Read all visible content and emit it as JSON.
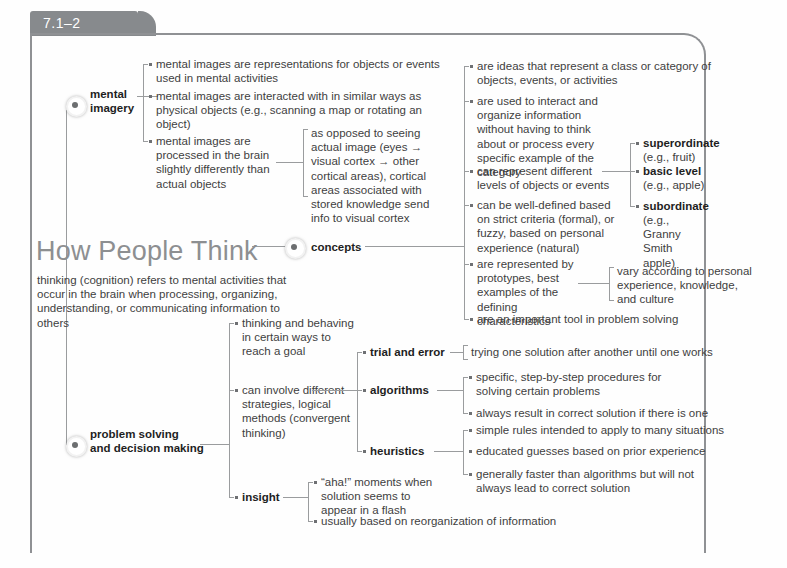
{
  "tab": {
    "label": "7.1–2"
  },
  "center": {
    "title": "How People Think",
    "subtitle": "thinking (cognition) refers to mental activities that occur in the brain when processing, organizing, understanding, or communicating information to others"
  },
  "nodes": {
    "mental_imagery": "mental\nimagery",
    "mental_imagery_line1": "mental",
    "mental_imagery_line2": "imagery",
    "concepts": "concepts",
    "problem_solving_line1": "problem solving",
    "problem_solving_line2": "and decision making"
  },
  "mental_imagery_branch": [
    {
      "name": "representations",
      "text": "mental images are representations for objects or events used in mental activities"
    },
    {
      "name": "interaction",
      "text": "mental images are interacted with in similar ways as physical objects (e.g., scanning a map or rotating an object)"
    },
    {
      "name": "processing",
      "text": "mental images are processed in the brain slightly differently than actual objects"
    }
  ],
  "mental_imagery_detail": {
    "name": "visual-cortex-path",
    "text": "as opposed to seeing actual image (eyes → visual cortex → other cortical areas), cortical areas associated with stored knowledge send info to visual cortex"
  },
  "concepts_branch": [
    {
      "name": "ideas-class-category",
      "text": "are ideas that represent a class or category of objects, events, or activities"
    },
    {
      "name": "interact-organize",
      "text": "are used to interact and organize information without having to think about or process every specific example of the category"
    },
    {
      "name": "different-levels",
      "text": "can represent different levels of objects or events"
    },
    {
      "name": "well-defined-fuzzy",
      "text": "can be well-defined based on strict criteria (formal), or fuzzy, based on personal experience (natural)"
    },
    {
      "name": "prototypes",
      "text": "are represented by prototypes, best examples of the defining characteristics"
    },
    {
      "name": "important-tool",
      "text": "are an important tool in problem solving"
    }
  ],
  "levels": [
    {
      "name": "superordinate",
      "label": "superordinate",
      "example": "(e.g., fruit)"
    },
    {
      "name": "basic-level",
      "label": "basic level",
      "example": "(e.g., apple)"
    },
    {
      "name": "subordinate",
      "label": "subordinate",
      "example": "(e.g., Granny Smith apple)"
    }
  ],
  "prototypes_detail": {
    "name": "vary-according",
    "text": "vary according to personal experience, knowledge, and culture"
  },
  "problem_solving_branch": [
    {
      "name": "goal-directed",
      "text": "thinking and behaving in certain ways to reach a goal"
    },
    {
      "name": "strategies",
      "text": "can involve different strategies, logical methods (convergent thinking)"
    }
  ],
  "strategies": [
    {
      "name": "trial-and-error",
      "label": "trial and error",
      "details": [
        {
          "name": "trial-detail-1",
          "text": "trying one solution after another until one works"
        }
      ]
    },
    {
      "name": "algorithms",
      "label": "algorithms",
      "details": [
        {
          "name": "algorithms-detail-1",
          "text": "specific, step-by-step procedures for solving certain problems"
        },
        {
          "name": "algorithms-detail-2",
          "text": "always result in correct solution if there is one"
        }
      ]
    },
    {
      "name": "heuristics",
      "label": "heuristics",
      "details": [
        {
          "name": "heuristics-detail-1",
          "text": "simple rules intended to apply to many situations"
        },
        {
          "name": "heuristics-detail-2",
          "text": "educated guesses based on prior experience"
        },
        {
          "name": "heuristics-detail-3",
          "text": "generally faster than algorithms but will not always lead to correct solution"
        }
      ]
    }
  ],
  "insight": {
    "name": "insight",
    "label": "insight",
    "details": [
      {
        "name": "insight-detail-1",
        "text": "“aha!” moments when solution seems to appear in a flash"
      },
      {
        "name": "insight-detail-2",
        "text": "usually based on reorganization of information"
      }
    ]
  },
  "colors": {
    "frame": "#8f9194",
    "tab": "#878a8d",
    "title": "#8d8f91",
    "body": "#3f3f3f",
    "bold": "#1e1e1e",
    "line": "#9a9c9e"
  }
}
